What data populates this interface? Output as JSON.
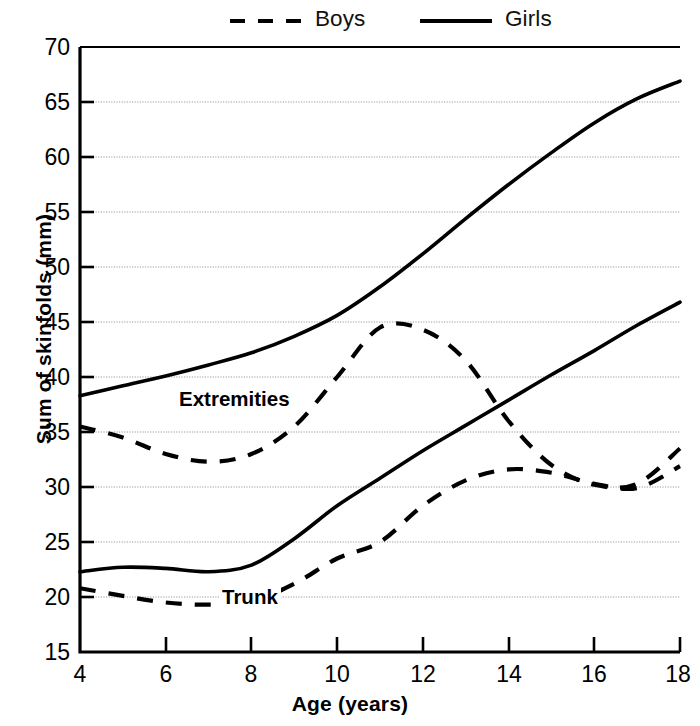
{
  "legend": {
    "position": "top-center",
    "entries": [
      {
        "label": "Boys",
        "style": "dashed",
        "color": "#000000",
        "name": "boys"
      },
      {
        "label": "Girls",
        "style": "solid",
        "color": "#000000",
        "name": "girls"
      }
    ]
  },
  "axes": {
    "xlabel": "Age (years)",
    "ylabel": "Sum of skinfolds (mm)",
    "xticks": [
      "4",
      "6",
      "8",
      "10",
      "12",
      "14",
      "16",
      "18"
    ],
    "yticks": [
      "15",
      "20",
      "25",
      "30",
      "35",
      "40",
      "45",
      "50",
      "55",
      "60",
      "65",
      "70"
    ]
  },
  "annotations": [
    {
      "text": "Extremities",
      "name": "extremities"
    },
    {
      "text": "Trunk",
      "name": "trunk"
    }
  ],
  "chart_data": {
    "type": "line",
    "title": "",
    "subtitle": "",
    "xlabel": "Age (years)",
    "ylabel": "Sum of skinfolds (mm)",
    "xlim": [
      4,
      18
    ],
    "ylim": [
      15,
      70
    ],
    "xticks": [
      4,
      6,
      8,
      10,
      12,
      14,
      16,
      18
    ],
    "yticks": [
      15,
      20,
      25,
      30,
      35,
      40,
      45,
      50,
      55,
      60,
      65,
      70
    ],
    "grid": "horizontal-dotted",
    "legend_position": "top-center",
    "annotations": [
      {
        "text": "Extremities",
        "x": 4.6,
        "y": 41.6
      },
      {
        "text": "Trunk",
        "x": 5.7,
        "y": 25.4
      }
    ],
    "x": [
      4,
      5,
      6,
      7,
      8,
      9,
      10,
      11,
      12,
      13,
      14,
      15,
      16,
      17,
      18
    ],
    "series": [
      {
        "name": "Girls Extremities",
        "group": "Extremities",
        "sex": "Girls",
        "style": "solid",
        "color": "#000000",
        "values": [
          38.3,
          39.2,
          40.1,
          41.1,
          42.2,
          43.7,
          45.6,
          48.2,
          51.2,
          54.4,
          57.5,
          60.4,
          63.1,
          65.3,
          66.9
        ]
      },
      {
        "name": "Boys Extremities",
        "group": "Extremities",
        "sex": "Boys",
        "style": "dashed",
        "color": "#000000",
        "values": [
          35.5,
          34.5,
          33.0,
          32.3,
          33.0,
          35.5,
          40.0,
          44.5,
          44.3,
          41.5,
          36.0,
          32.0,
          30.2,
          30.3,
          33.5
        ]
      },
      {
        "name": "Girls Trunk",
        "group": "Trunk",
        "sex": "Girls",
        "style": "solid",
        "color": "#000000",
        "values": [
          22.3,
          22.7,
          22.6,
          22.3,
          22.9,
          25.3,
          28.3,
          30.8,
          33.3,
          35.6,
          37.9,
          40.2,
          42.4,
          44.7,
          46.8
        ]
      },
      {
        "name": "Boys Trunk",
        "group": "Trunk",
        "sex": "Boys",
        "style": "dashed",
        "color": "#000000",
        "values": [
          20.8,
          20.1,
          19.5,
          19.3,
          19.6,
          21.2,
          23.5,
          25.0,
          28.3,
          30.6,
          31.6,
          31.3,
          30.3,
          29.9,
          31.9
        ]
      }
    ]
  }
}
